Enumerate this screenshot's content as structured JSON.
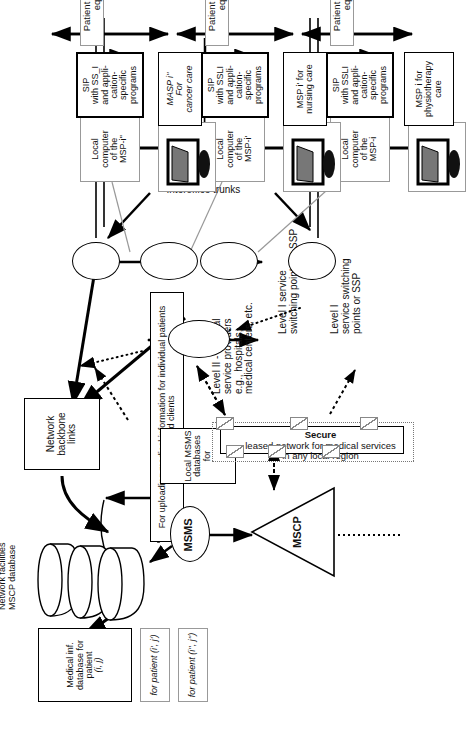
{
  "figure": {
    "domain": "network-architecture-diagram",
    "orientation": "rotated-90"
  },
  "left_column": {
    "db_stack_label": "Network facilities\nMSCP database",
    "patient_boxes": [
      {
        "name": "patient-db-primary",
        "line1": "Medical  inf.",
        "line2": "database for patient",
        "line3": "(i, j)"
      },
      {
        "name": "patient-db-second",
        "line1": "for patient (i', j')"
      },
      {
        "name": "patient-db-third",
        "line1": "for patient (i'', j'')"
      }
    ],
    "upload_note": "For uploading medical information for individual patients and clients",
    "msms_label": "MSMS",
    "mscp_label": "MSCP",
    "local_msms_box": "Local MSMS\ndatabases for"
  },
  "center": {
    "secure_network_bold": "Secure",
    "secure_network_rest": "leased network for medical services\nin any local region",
    "backbone_box": "Network backbone\nlinks",
    "interoffice_trunks": "Interoffice  trunks",
    "level2_label": "Level II - medical\nservice providers\ne.g., hospitals,\nmedical centers, etc.",
    "level1_label_top": "Level I service\nswitching points or SSP",
    "level1_label_bottom": "Level I\nservice switching\npoints or SSP"
  },
  "sites": [
    {
      "id": "site-1",
      "local_computer": "Local\ncomputer\nof the\nMSP-i",
      "sip_box": "SIP\nwith SSLI\nand appli-\ncation-\nspecific\nprograms",
      "msp_label": "MSP i for\nphysiotherapy\ncare",
      "premises_label": "Patient premises PC equipment"
    },
    {
      "id": "site-2",
      "local_computer": "Local\ncomputer\nof the\nMSP-i'",
      "sip_box": "SIP\nwith SSLI\nand appli-\ncation-\nspecific\nprograms",
      "msp_label": "MSP i' for\nnursing care",
      "premises_label": "Patient premises PC equipment"
    },
    {
      "id": "site-3",
      "local_computer": "Local\ncomputer\nof the\nMSP-i''",
      "sip_box": "SIP\nwith SS_I\nand appli-\ncation-\nspecific\nprograms",
      "msp_label": "MASP i''\nFor\ncancer care",
      "premises_label": "Patient premises PC equipment"
    }
  ],
  "colors": {
    "ink": "#000000",
    "grey_line": "#9a9a9a",
    "paper": "#ffffff"
  }
}
